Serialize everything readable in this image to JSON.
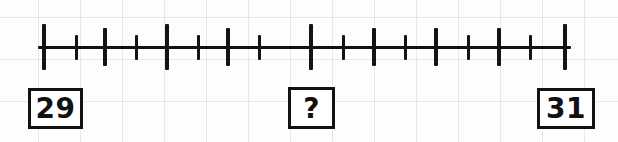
{
  "worksheet": {
    "title": "Number line between 29 and 31",
    "background_color": "#fdfdfd",
    "ink_color": "#121212",
    "grid_color": "#b0bac6"
  },
  "numberline": {
    "start_value": "29",
    "end_value": "31",
    "unknown_marker": "?",
    "axis": {
      "x_start_px": 38,
      "x_end_px": 571,
      "baseline_y_px": 47,
      "thickness_px": 3
    },
    "tick_count": 17,
    "tick_spacing_px": 32.6,
    "tick_heights": {
      "tall_px": 46,
      "medium_px": 38,
      "short_px": 25
    },
    "ticks": [
      {
        "index": 0,
        "x_px": 44,
        "size": "tall",
        "value": "29"
      },
      {
        "index": 1,
        "x_px": 76,
        "size": "short",
        "value": ""
      },
      {
        "index": 2,
        "x_px": 105,
        "size": "medium",
        "value": ""
      },
      {
        "index": 3,
        "x_px": 136,
        "size": "short",
        "value": ""
      },
      {
        "index": 4,
        "x_px": 167,
        "size": "tall",
        "value": ""
      },
      {
        "index": 5,
        "x_px": 198,
        "size": "short",
        "value": ""
      },
      {
        "index": 6,
        "x_px": 228,
        "size": "medium",
        "value": ""
      },
      {
        "index": 7,
        "x_px": 259,
        "size": "short",
        "value": ""
      },
      {
        "index": 8,
        "x_px": 311,
        "size": "tall",
        "value": "?"
      },
      {
        "index": 9,
        "x_px": 343,
        "size": "short",
        "value": ""
      },
      {
        "index": 10,
        "x_px": 374,
        "size": "medium",
        "value": ""
      },
      {
        "index": 11,
        "x_px": 405,
        "size": "short",
        "value": ""
      },
      {
        "index": 12,
        "x_px": 436,
        "size": "medium",
        "value": ""
      },
      {
        "index": 13,
        "x_px": 468,
        "size": "short",
        "value": ""
      },
      {
        "index": 14,
        "x_px": 499,
        "size": "medium",
        "value": ""
      },
      {
        "index": 15,
        "x_px": 530,
        "size": "short",
        "value": ""
      },
      {
        "index": 16,
        "x_px": 565,
        "size": "tall",
        "value": "31"
      }
    ]
  },
  "labels": {
    "left": "29",
    "middle": "?",
    "right": "31"
  }
}
